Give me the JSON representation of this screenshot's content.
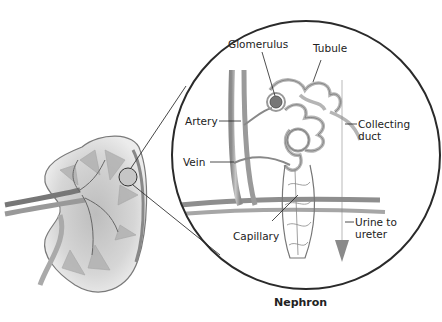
{
  "diagram": {
    "title": "Nephron",
    "labels": {
      "glomerulus": "Glomerulus",
      "tubule": "Tubule",
      "artery": "Artery",
      "vein": "Vein",
      "collecting_duct_line1": "Collecting",
      "collecting_duct_line2": "duct",
      "capillary": "Capillary",
      "urine_line1": "Urine to",
      "urine_line2": "ureter"
    },
    "parts": [
      "kidney cross-section",
      "magnified nephron view"
    ]
  }
}
